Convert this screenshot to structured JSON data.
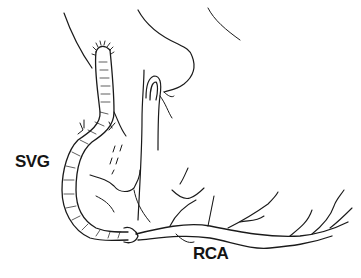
{
  "figure": {
    "labels": {
      "svg": "SVG",
      "rca": "RCA"
    },
    "colors": {
      "ink": "#1a1a1a",
      "background": "#ffffff"
    }
  }
}
